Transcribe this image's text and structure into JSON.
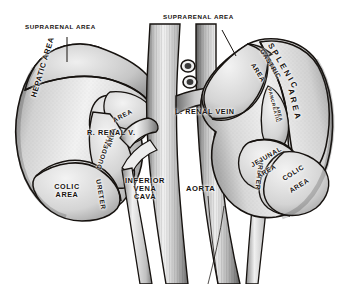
{
  "figure": {
    "style": "black and white line engraving with stipple shading",
    "background_color": "#ffffff",
    "ink_color": "#16120f"
  },
  "labels": {
    "suprarenal_area_left": "SUPRARENAL AREA",
    "suprarenal_area_right": "SUPRARENAL AREA",
    "hepatic_area": "HEPATIC AREA",
    "duodenal_area": "DUODENAL AREA",
    "duodenal_short": "DUODENAL",
    "area_word": "AREA",
    "colic_area_left": "COLIC AREA",
    "colic_area_left_l1": "COLIC",
    "colic_area_left_l2": "AREA",
    "right_renal_vein": "R. RENAL V.",
    "left_renal_vein": "L. RENAL VEIN",
    "inferior_vena_cava": "INFERIOR VENA CAVA",
    "ivc_l1": "INFERIOR",
    "ivc_l2": "VENA",
    "ivc_l3": "CAVA",
    "aorta": "AORTA",
    "ureter_left": "URETER",
    "ureter_right": "URETER",
    "gastric_area": "GASTRIC AREA",
    "gastric_l1": "GASTRIC",
    "gastric_l2": "AREA",
    "splenic_area": "SPLENIC AREA",
    "splenic_l1": "SPLENIC",
    "splenic_l2": "AREA",
    "pancreatic_area": "PANCREATIC AREA",
    "pancreatic_l1": "PANCREATIC",
    "pancreatic_l2": "AREA",
    "jejunal_area": "JEJUNAL AREA",
    "jejunal_l1": "JEJUNAL",
    "jejunal_l2": "AREA",
    "colic_area_right": "COLIC AREA",
    "colic_area_right_l1": "COLIC",
    "colic_area_right_l2": "AREA"
  }
}
